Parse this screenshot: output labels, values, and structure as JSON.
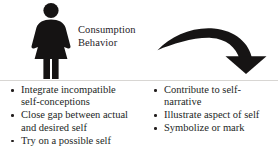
{
  "slide": {
    "background_color": "#ffffff",
    "text_color": "#231f1e",
    "divider_color": "#d8d6d3"
  },
  "top": {
    "person_icon": "female-figure-silhouette-icon",
    "heading": {
      "line1": "Consumption",
      "line2": "Behavior"
    },
    "arrow_icon": "curved-down-right-arrow-icon"
  },
  "columns": {
    "left": {
      "name": "consumption-behavior-functions-left",
      "items": [
        "Integrate incompatible self-conceptions",
        "Close gap between actual and desired self",
        "Try on a possible self"
      ]
    },
    "right": {
      "name": "consumption-behavior-functions-right",
      "items": [
        "Contribute to self-narrative",
        "Illustrate aspect of self",
        "Symbolize or mark"
      ]
    }
  }
}
